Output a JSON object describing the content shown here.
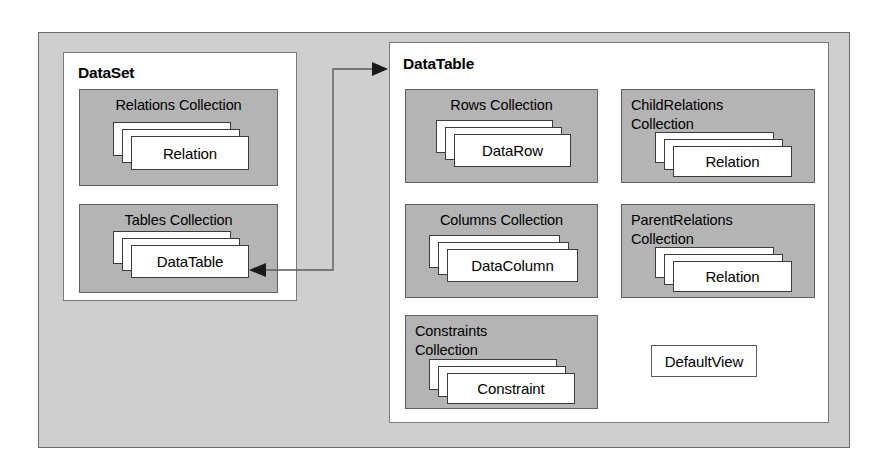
{
  "diagram": {
    "frame_color": "#cfcfcf",
    "panel_color": "#ffffff",
    "collection_color": "#b4b4b4",
    "card_color": "#ffffff",
    "line_color": "#5f5f5f"
  },
  "dataset": {
    "title": "DataSet",
    "collections": [
      {
        "label": "Relations Collection",
        "item": "Relation"
      },
      {
        "label": "Tables Collection",
        "item": "DataTable"
      }
    ]
  },
  "datatable": {
    "title": "DataTable",
    "collections": [
      {
        "label": "Rows Collection",
        "item": "DataRow"
      },
      {
        "label": "Columns Collection",
        "item": "DataColumn"
      },
      {
        "label": "Constraints\nCollection",
        "item": "Constraint"
      },
      {
        "label": "ChildRelations\nCollection",
        "item": "Relation"
      },
      {
        "label": "ParentRelations\nCollection",
        "item": "Relation"
      }
    ],
    "default_view": "DefaultView"
  },
  "connector": {
    "name": "dataset-datatable-link",
    "from": "Tables Collection DataTable",
    "to": "DataTable"
  }
}
